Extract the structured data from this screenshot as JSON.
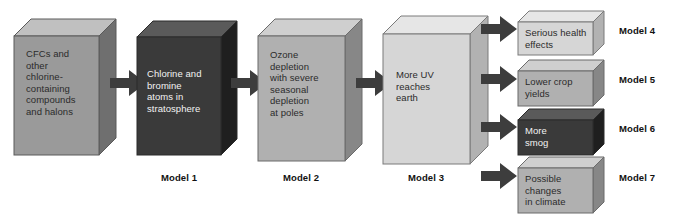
{
  "figure": {
    "caption": "",
    "background_color": "#ffffff"
  },
  "colors": {
    "box_gray_front": "#9a9a9a",
    "box_gray_top": "#c0c0c0",
    "box_gray_side": "#6f6f6f",
    "box_dark_front": "#3a3a3a",
    "box_dark_top": "#5a5a5a",
    "box_dark_side": "#1f1f1f",
    "box_mid_front": "#b0b0b0",
    "box_mid_top": "#cfcfcf",
    "box_mid_side": "#878787",
    "box_light_front": "#d6d6d6",
    "box_light_top": "#e6e6e6",
    "box_light_side": "#b2b2b2",
    "arrow_fill": "#3d3d3d",
    "outline": "#5a5a5a",
    "text_dark": "#2b2b2b",
    "text_light": "#f2f2f2",
    "label_text": "#111111"
  },
  "chain": [
    {
      "id": "cfcs",
      "text": "CFCs and\nother\nchlorine-\ncontaining\ncompounds\nand halons",
      "model_label": "",
      "tone": "gray",
      "text_color": "dark"
    },
    {
      "id": "chlorine-bromine",
      "text": "Chlorine and\nbromine\natoms in\nstratosphere",
      "model_label": "Model 1",
      "tone": "dark",
      "text_color": "light"
    },
    {
      "id": "ozone-depletion",
      "text": "Ozone\ndepletion\nwith severe\nseasonal\ndepletion\nat poles",
      "model_label": "Model 2",
      "tone": "mid",
      "text_color": "dark"
    },
    {
      "id": "more-uv",
      "text": "More UV\nreaches\nearth",
      "model_label": "Model 3",
      "tone": "light",
      "text_color": "dark"
    }
  ],
  "outcomes": [
    {
      "id": "serious-health-effects",
      "text": "Serious health\neffects",
      "model_label": "Model 4",
      "tone": "light",
      "text_color": "dark"
    },
    {
      "id": "lower-crop-yields",
      "text": "Lower crop\nyields",
      "model_label": "Model 5",
      "tone": "mid",
      "text_color": "dark"
    },
    {
      "id": "more-smog",
      "text": "More\nsmog",
      "model_label": "Model 6",
      "tone": "dark",
      "text_color": "light"
    },
    {
      "id": "possible-climate-changes",
      "text": "Possible\nchanges\nin climate",
      "model_label": "Model 7",
      "tone": "mid",
      "text_color": "dark"
    }
  ],
  "arrows": {
    "chain": [
      {
        "id": "arrow-cfcs-to-chlorine"
      },
      {
        "id": "arrow-chlorine-to-ozone"
      },
      {
        "id": "arrow-ozone-to-uv"
      }
    ],
    "branch": [
      {
        "id": "arrow-uv-to-health"
      },
      {
        "id": "arrow-uv-to-crops"
      },
      {
        "id": "arrow-uv-to-smog"
      },
      {
        "id": "arrow-uv-to-climate"
      }
    ]
  }
}
